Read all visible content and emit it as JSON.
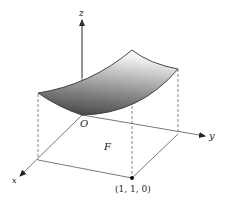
{
  "figure": {
    "axes": {
      "z_label": "z",
      "y_label": "y",
      "x_label": "x",
      "origin_label": "O"
    },
    "region_label": "F",
    "point_label": "(1, 1, 0)",
    "colors": {
      "line": "#333333",
      "surface_dark": "#4a4a4a",
      "surface_light": "#f2f2f2"
    }
  }
}
